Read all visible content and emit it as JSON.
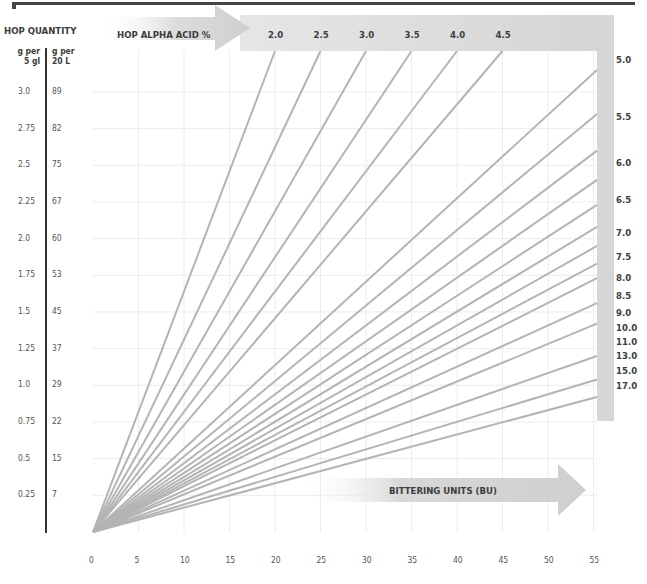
{
  "chart_data": {
    "type": "line",
    "title": "",
    "xlabel": "BITTERING UNITS (BU)",
    "ylabel": "HOP QUANTITY",
    "top_axis_label": "HOP ALPHA ACID %",
    "y_left_headers": {
      "col1": "g per 5 gl",
      "col2": "g per 20 L"
    },
    "y_ticks_g_per_5gl": [
      "3.0",
      "2.75",
      "2.5",
      "2.25",
      "2.0",
      "1.75",
      "1.5",
      "1.25",
      "1.0",
      "0.75",
      "0.5",
      "0.25"
    ],
    "y_ticks_g_per_20L": [
      "89",
      "82",
      "75",
      "67",
      "60",
      "53",
      "45",
      "37",
      "29",
      "22",
      "15",
      "7"
    ],
    "x_ticks": [
      "0",
      "5",
      "10",
      "15",
      "20",
      "25",
      "30",
      "35",
      "40",
      "45",
      "50",
      "55"
    ],
    "xlim": [
      0,
      55
    ],
    "ylim_g_per_5gl": [
      0,
      3.25
    ],
    "grid": true,
    "series_top_labels": [
      "2.0",
      "2.5",
      "3.0",
      "3.5",
      "4.0",
      "4.5"
    ],
    "series_right_labels": [
      "5.0",
      "5.5",
      "6.0",
      "6.5",
      "7.0",
      "7.5",
      "8.0",
      "8.5",
      "9.0",
      "10.0",
      "11.0",
      "13.0",
      "15.0",
      "17.0"
    ],
    "series": [
      {
        "name": "2.0",
        "end": {
          "x": 20,
          "y": 3.25
        }
      },
      {
        "name": "2.5",
        "end": {
          "x": 25,
          "y": 3.25
        }
      },
      {
        "name": "3.0",
        "end": {
          "x": 30,
          "y": 3.25
        }
      },
      {
        "name": "3.5",
        "end": {
          "x": 35,
          "y": 3.25
        }
      },
      {
        "name": "4.0",
        "end": {
          "x": 40,
          "y": 3.25
        }
      },
      {
        "name": "4.5",
        "end": {
          "x": 45,
          "y": 3.25
        }
      },
      {
        "name": "5.0",
        "end": {
          "x": 55,
          "y": 3.15
        }
      },
      {
        "name": "5.5",
        "end": {
          "x": 55,
          "y": 2.85
        }
      },
      {
        "name": "6.0",
        "end": {
          "x": 55,
          "y": 2.6
        }
      },
      {
        "name": "6.5",
        "end": {
          "x": 55,
          "y": 2.4
        }
      },
      {
        "name": "7.0",
        "end": {
          "x": 55,
          "y": 2.23
        }
      },
      {
        "name": "7.5",
        "end": {
          "x": 55,
          "y": 2.08
        }
      },
      {
        "name": "8.0",
        "end": {
          "x": 55,
          "y": 1.95
        }
      },
      {
        "name": "8.5",
        "end": {
          "x": 55,
          "y": 1.83
        }
      },
      {
        "name": "9.0",
        "end": {
          "x": 55,
          "y": 1.73
        }
      },
      {
        "name": "10.0",
        "end": {
          "x": 55,
          "y": 1.56
        }
      },
      {
        "name": "11.0",
        "end": {
          "x": 55,
          "y": 1.42
        }
      },
      {
        "name": "13.0",
        "end": {
          "x": 55,
          "y": 1.2
        }
      },
      {
        "name": "15.0",
        "end": {
          "x": 55,
          "y": 1.04
        }
      },
      {
        "name": "17.0",
        "end": {
          "x": 55,
          "y": 0.92
        }
      }
    ],
    "colors": {
      "lines": "#b4b4b4",
      "band": "#d6d6d6",
      "grid": "#ececec",
      "text": "#3c3c3c"
    }
  },
  "labels": {
    "hop_quantity": "HOP QUANTITY",
    "hop_alpha_acid": "HOP ALPHA ACID %",
    "bittering_units": "BITTERING UNITS (BU)",
    "g_per_5gl_line1": "g per",
    "g_per_5gl_line2": "5 gl",
    "g_per_20L_line1": "g per",
    "g_per_20L_line2": "20 L"
  }
}
